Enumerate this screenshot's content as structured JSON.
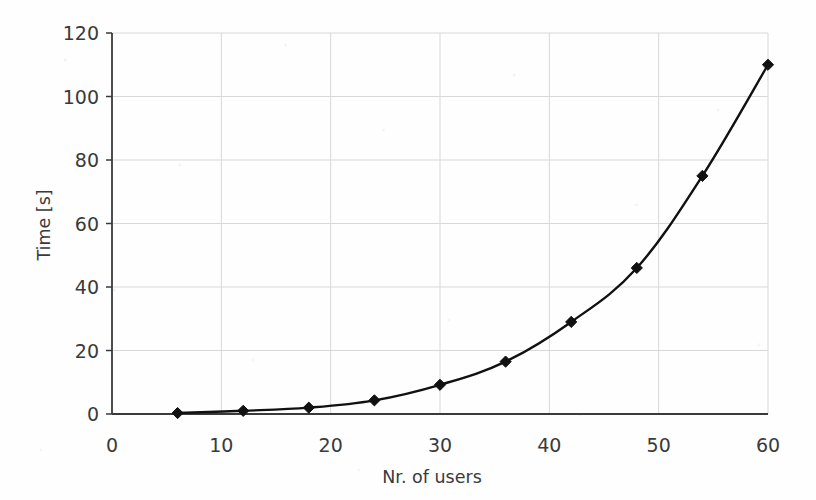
{
  "chart_data": {
    "type": "line",
    "title": "",
    "xlabel": "Nr. of users",
    "ylabel": "Time [s]",
    "xlim": [
      0,
      60
    ],
    "ylim": [
      0,
      120
    ],
    "xticks": [
      0,
      10,
      20,
      30,
      40,
      50,
      60
    ],
    "yticks": [
      0,
      20,
      40,
      60,
      80,
      100,
      120
    ],
    "xtick_labels": [
      "0",
      "10",
      "20",
      "30",
      "40",
      "50",
      "60"
    ],
    "ytick_labels": [
      "0",
      "20",
      "40",
      "60",
      "80",
      "100",
      "120"
    ],
    "grid": true,
    "legend": null,
    "marker": "diamond",
    "line_color": "#111111",
    "marker_color": "#111111",
    "grid_color": "#d8d8d8",
    "axis_color": "#3a3a3a",
    "x": [
      6,
      12,
      18,
      24,
      30,
      36,
      42,
      48,
      54,
      60
    ],
    "values": [
      0.3,
      1.0,
      2.0,
      4.3,
      9.2,
      16.5,
      29.0,
      46.0,
      75.0,
      110.0
    ],
    "series": [
      {
        "name": "Time",
        "x": [
          6,
          12,
          18,
          24,
          30,
          36,
          42,
          48,
          54,
          60
        ],
        "values": [
          0.3,
          1.0,
          2.0,
          4.3,
          9.2,
          16.5,
          29.0,
          46.0,
          75.0,
          110.0
        ]
      }
    ]
  }
}
